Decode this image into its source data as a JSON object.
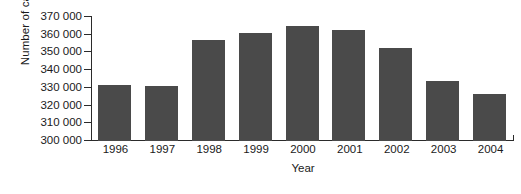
{
  "chart_data": {
    "type": "bar",
    "title": "",
    "xlabel": "Year",
    "ylabel": "Number of cases",
    "categories": [
      "1996",
      "1997",
      "1998",
      "1999",
      "2000",
      "2001",
      "2002",
      "2003",
      "2004"
    ],
    "values": [
      331500,
      330800,
      357000,
      360700,
      364900,
      362800,
      352300,
      334000,
      326500
    ],
    "ylim": [
      300000,
      370000
    ],
    "ytick_step": 10000,
    "ytick_labels": [
      "370 000",
      "360 000",
      "350 000",
      "340 000",
      "330 000",
      "320 000",
      "310 000",
      "300 000"
    ],
    "ytick_values": [
      370000,
      360000,
      350000,
      340000,
      330000,
      320000,
      310000,
      300000
    ],
    "grid": false,
    "legend": null,
    "bar_color": "#4a4a4a",
    "axis_color": "#2b2b2b",
    "background_color": "#ffffff"
  }
}
